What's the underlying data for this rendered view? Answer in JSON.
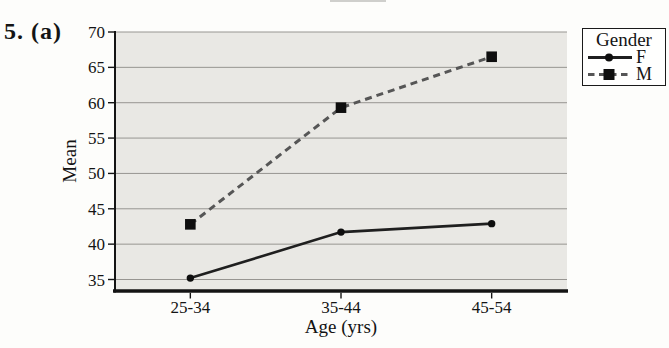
{
  "page": {
    "question_label": "5. (a)"
  },
  "chart_data": {
    "type": "line",
    "title": "",
    "categories": [
      "25-34",
      "35-44",
      "45-54"
    ],
    "series": [
      {
        "name": "F",
        "values": [
          35.2,
          41.7,
          42.9
        ],
        "line_style": "solid",
        "marker": "circle",
        "color": "#1f1f1f"
      },
      {
        "name": "M",
        "values": [
          42.8,
          59.3,
          66.5
        ],
        "line_style": "dashed",
        "marker": "square",
        "color": "#565656"
      }
    ],
    "xlabel": "Age (yrs)",
    "ylabel": "Mean",
    "ylim": [
      35,
      70
    ],
    "yticks": [
      35,
      40,
      45,
      50,
      55,
      60,
      65,
      70
    ],
    "grid": "horizontal",
    "legend": {
      "title": "Gender",
      "position": "outside-top-right"
    },
    "colors": {
      "plot_background": "#e9e8e4",
      "gridline": "#979591",
      "axis": "#141414",
      "marker": "#0e0e0e"
    }
  }
}
